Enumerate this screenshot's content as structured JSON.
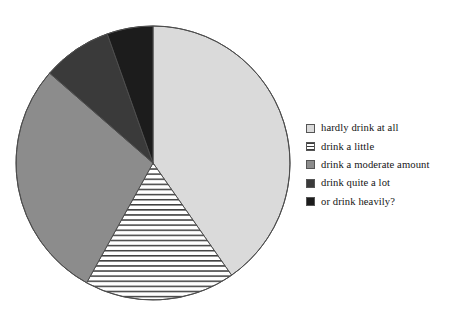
{
  "chart_data": {
    "type": "pie",
    "title": "",
    "subtitle": "",
    "xlabel": "",
    "ylabel": "",
    "legend_position": "right",
    "grid": false,
    "start_angle_deg": 0,
    "direction": "clockwise",
    "center": {
      "x": 153,
      "y": 163
    },
    "radius": 137,
    "categories": [
      "hardly drink at all",
      "drink a little",
      "drink a moderate amount",
      "drink quite a lot",
      "or drink heavily?"
    ],
    "values": [
      40.3,
      17.8,
      28.3,
      8.2,
      5.4
    ],
    "units": "percent",
    "slices": [
      {
        "label": "hardly drink at all",
        "value": 40.3,
        "start_deg": 0,
        "end_deg": 145,
        "fill": "#dadada",
        "pattern": "solid",
        "stroke": "#4d4d4d"
      },
      {
        "label": "drink a little",
        "value": 17.8,
        "start_deg": 145,
        "end_deg": 209,
        "fill": "#ffffff",
        "pattern": "horizontal-lines",
        "stroke": "#4d4d4d"
      },
      {
        "label": "drink a moderate amount",
        "value": 28.3,
        "start_deg": 209,
        "end_deg": 311,
        "fill": "#8c8c8c",
        "pattern": "solid",
        "stroke": "#4d4d4d"
      },
      {
        "label": "drink quite a lot",
        "value": 8.2,
        "start_deg": 311,
        "end_deg": 340.5,
        "fill": "#3a3a3a",
        "pattern": "solid",
        "stroke": "#4d4d4d"
      },
      {
        "label": "or drink heavily?",
        "value": 5.4,
        "start_deg": 340.5,
        "end_deg": 360,
        "fill": "#1c1c1c",
        "pattern": "solid",
        "stroke": "#4d4d4d"
      }
    ]
  },
  "legend": {
    "items": [
      {
        "label": "hardly drink at all",
        "swatch": "light-gray-solid",
        "color": "#dadada",
        "pattern": "solid"
      },
      {
        "label": "drink a little",
        "swatch": "white-horizontal-hatch",
        "color": "#ffffff",
        "pattern": "horizontal-lines"
      },
      {
        "label": "drink a moderate amount",
        "swatch": "medium-gray-solid",
        "color": "#8c8c8c",
        "pattern": "solid"
      },
      {
        "label": "drink quite a lot",
        "swatch": "dark-gray-solid",
        "color": "#3a3a3a",
        "pattern": "solid"
      },
      {
        "label": "or drink heavily?",
        "swatch": "black-solid",
        "color": "#1c1c1c",
        "pattern": "solid"
      }
    ]
  },
  "colors": {
    "background": "#ffffff",
    "outline": "#4d4d4d",
    "text": "#141414"
  }
}
